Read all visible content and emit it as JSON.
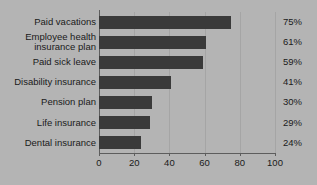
{
  "chart_data": {
    "type": "bar",
    "orientation": "horizontal",
    "title": "",
    "xlabel": "",
    "ylabel": "",
    "categories": [
      "Paid vacations",
      "Employee health\ninsurance plan",
      "Paid sick leave",
      "Disability insurance",
      "Pension plan",
      "Life insurance",
      "Dental insurance"
    ],
    "values": [
      75,
      61,
      59,
      41,
      30,
      29,
      24
    ],
    "value_labels": [
      "75%",
      "61%",
      "59%",
      "41%",
      "30%",
      "29%",
      "24%"
    ],
    "xlim": [
      0,
      100
    ],
    "xticks": [
      0,
      20,
      40,
      60,
      80,
      100
    ],
    "xtick_labels": [
      "0",
      "20",
      "40",
      "60",
      "80",
      "100"
    ],
    "grid": true,
    "legend": false,
    "colors": {
      "bar": "#3a3a3a",
      "background": "#b4b4b4",
      "gridline": "#a5a5a5",
      "axis": "#5d5d5d",
      "text": "#1a1a1a"
    }
  }
}
